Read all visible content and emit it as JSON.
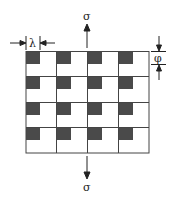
{
  "diagram": {
    "type": "grid-with-squares",
    "rows": 4,
    "cols": 4,
    "grid_color": "#444444",
    "square_color": "#4a4a4a",
    "labels": {
      "stress_top": "σ",
      "stress_bottom": "σ",
      "spacing": "λ",
      "height": "φ"
    }
  }
}
